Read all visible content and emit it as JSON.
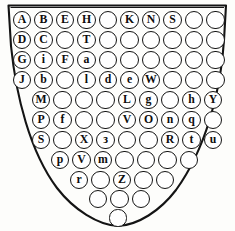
{
  "figure": {
    "name": "shield-letter-grid",
    "colors": {
      "ink": "#141414",
      "paper": "#fdfdfb",
      "circle_fill": "#ffffff"
    },
    "outline": {
      "shape": "shield",
      "stroke_width_px": 2,
      "top_left_x": 8,
      "top_right_x": 226,
      "top_y": 5,
      "bottom_point_x": 118,
      "bottom_point_y": 226
    },
    "counts": {
      "rows": 11,
      "total_circles": 82,
      "lettered_circles": 37,
      "blank_circles": 45
    }
  },
  "grid": {
    "row_labels": [
      "row-1",
      "row-2",
      "row-3",
      "row-4",
      "row-5",
      "row-6",
      "row-7",
      "row-8",
      "row-9",
      "row-10",
      "row-11"
    ],
    "rows": [
      {
        "index": 1,
        "count": 10,
        "y": 20,
        "x_start": 22,
        "step": 21.5,
        "radius": 9.2,
        "cells": [
          {
            "label": "A",
            "filled": true
          },
          {
            "label": "B",
            "filled": true
          },
          {
            "label": "E",
            "filled": true
          },
          {
            "label": "H",
            "filled": true
          },
          {
            "label": "",
            "filled": false
          },
          {
            "label": "K",
            "filled": true
          },
          {
            "label": "N",
            "filled": true
          },
          {
            "label": "S",
            "filled": true
          },
          {
            "label": "",
            "filled": false
          },
          {
            "label": "",
            "filled": false
          }
        ]
      },
      {
        "index": 2,
        "count": 10,
        "y": 40,
        "x_start": 22,
        "step": 21.5,
        "radius": 9.2,
        "cells": [
          {
            "label": "D",
            "filled": true
          },
          {
            "label": "C",
            "filled": true
          },
          {
            "label": "",
            "filled": false
          },
          {
            "label": "T",
            "filled": true
          },
          {
            "label": "",
            "filled": false
          },
          {
            "label": "",
            "filled": false
          },
          {
            "label": "",
            "filled": false
          },
          {
            "label": "",
            "filled": false
          },
          {
            "label": "",
            "filled": false
          },
          {
            "label": "",
            "filled": false
          }
        ]
      },
      {
        "index": 3,
        "count": 10,
        "y": 60,
        "x_start": 22,
        "step": 21.5,
        "radius": 9.2,
        "cells": [
          {
            "label": "G",
            "filled": true
          },
          {
            "label": "i",
            "filled": true
          },
          {
            "label": "F",
            "filled": true
          },
          {
            "label": "a",
            "filled": true
          },
          {
            "label": "",
            "filled": false
          },
          {
            "label": "",
            "filled": false
          },
          {
            "label": "",
            "filled": false
          },
          {
            "label": "",
            "filled": false
          },
          {
            "label": "",
            "filled": false
          },
          {
            "label": "",
            "filled": false
          }
        ]
      },
      {
        "index": 4,
        "count": 10,
        "y": 80,
        "x_start": 22,
        "step": 21.5,
        "radius": 9.2,
        "cells": [
          {
            "label": "J",
            "filled": true
          },
          {
            "label": "b",
            "filled": true
          },
          {
            "label": "",
            "filled": false
          },
          {
            "label": "l",
            "filled": true
          },
          {
            "label": "d",
            "filled": true
          },
          {
            "label": "e",
            "filled": true
          },
          {
            "label": "W",
            "filled": true
          },
          {
            "label": "",
            "filled": false
          },
          {
            "label": "",
            "filled": false
          },
          {
            "label": "",
            "filled": false
          }
        ]
      },
      {
        "index": 5,
        "count": 9,
        "y": 100,
        "x_start": 41,
        "step": 21.5,
        "radius": 9.2,
        "cells": [
          {
            "label": "M",
            "filled": true
          },
          {
            "label": "",
            "filled": false
          },
          {
            "label": "",
            "filled": false
          },
          {
            "label": "",
            "filled": false
          },
          {
            "label": "L",
            "filled": true
          },
          {
            "label": "g",
            "filled": true
          },
          {
            "label": "",
            "filled": false
          },
          {
            "label": "h",
            "filled": true
          },
          {
            "label": "Y",
            "filled": true
          }
        ]
      },
      {
        "index": 6,
        "count": 9,
        "y": 120,
        "x_start": 41,
        "step": 21.5,
        "radius": 9.2,
        "cells": [
          {
            "label": "P",
            "filled": true
          },
          {
            "label": "f",
            "filled": true
          },
          {
            "label": "",
            "filled": false
          },
          {
            "label": "",
            "filled": false
          },
          {
            "label": "V",
            "filled": true
          },
          {
            "label": "O",
            "filled": true
          },
          {
            "label": "n",
            "filled": true
          },
          {
            "label": "q",
            "filled": true
          },
          {
            "label": "",
            "filled": false
          }
        ]
      },
      {
        "index": 7,
        "count": 9,
        "y": 140,
        "x_start": 41,
        "step": 21.5,
        "radius": 9.2,
        "cells": [
          {
            "label": "S",
            "filled": true
          },
          {
            "label": "",
            "filled": false
          },
          {
            "label": "X",
            "filled": true
          },
          {
            "label": "з",
            "filled": true
          },
          {
            "label": "",
            "filled": false
          },
          {
            "label": "",
            "filled": false
          },
          {
            "label": "R",
            "filled": true
          },
          {
            "label": "t",
            "filled": true
          },
          {
            "label": "u",
            "filled": true
          }
        ]
      },
      {
        "index": 8,
        "count": 7,
        "y": 160,
        "x_start": 60,
        "step": 21.5,
        "radius": 9.2,
        "cells": [
          {
            "label": "p",
            "filled": true
          },
          {
            "label": "V",
            "filled": true
          },
          {
            "label": "m",
            "filled": true
          },
          {
            "label": "",
            "filled": false
          },
          {
            "label": "",
            "filled": false
          },
          {
            "label": "",
            "filled": false
          },
          {
            "label": "",
            "filled": false
          }
        ]
      },
      {
        "index": 9,
        "count": 5,
        "y": 180,
        "x_start": 79,
        "step": 21.5,
        "radius": 9.2,
        "cells": [
          {
            "label": "r",
            "filled": true
          },
          {
            "label": "",
            "filled": false
          },
          {
            "label": "Z",
            "filled": true
          },
          {
            "label": "",
            "filled": false
          },
          {
            "label": "",
            "filled": false
          }
        ]
      },
      {
        "index": 10,
        "count": 3,
        "y": 199,
        "x_start": 98,
        "step": 21.5,
        "radius": 9.2,
        "cells": [
          {
            "label": "",
            "filled": false
          },
          {
            "label": "",
            "filled": false
          },
          {
            "label": "",
            "filled": false
          }
        ]
      },
      {
        "index": 11,
        "count": 1,
        "y": 218,
        "x_start": 118,
        "step": 21.5,
        "radius": 8.6,
        "cells": [
          {
            "label": "",
            "filled": false
          }
        ]
      }
    ]
  }
}
